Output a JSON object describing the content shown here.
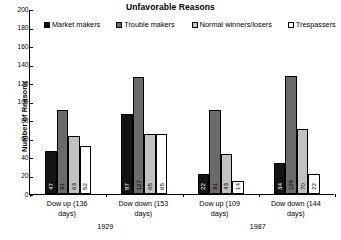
{
  "chart_data": {
    "type": "bar",
    "title": "Unfavorable Reasons",
    "xlabel": "",
    "ylabel": "Number of Reasons",
    "ylim": [
      0,
      200
    ],
    "yticks": [
      0,
      20,
      40,
      60,
      80,
      100,
      120,
      140,
      160,
      180,
      200
    ],
    "grid": false,
    "legend_position": "top",
    "categories": [
      "Dow up (136 days)",
      "Dow down (153 days)",
      "Dow up (109 days)",
      "Dow down (144 days)"
    ],
    "category_lines": [
      [
        "Dow up (136",
        "days)"
      ],
      [
        "Dow down (153",
        "days)"
      ],
      [
        "Dow up (109",
        "days)"
      ],
      [
        "Dow down (144",
        "days)"
      ]
    ],
    "groups": [
      {
        "label": "1929",
        "categories": [
          0,
          1
        ]
      },
      {
        "label": "1987",
        "categories": [
          2,
          3
        ]
      }
    ],
    "series": [
      {
        "name": "Market makers",
        "color": "#141414",
        "values": [
          47,
          87,
          22,
          34
        ]
      },
      {
        "name": "Trouble makers",
        "color": "#6b6b6b",
        "values": [
          91,
          127,
          91,
          128
        ]
      },
      {
        "name": "Normal winners/losers",
        "color": "#c2c2c2",
        "values": [
          63,
          65,
          43,
          70
        ]
      },
      {
        "name": "Trespassers",
        "color": "#ffffff",
        "values": [
          52,
          65,
          14,
          22
        ]
      }
    ]
  }
}
